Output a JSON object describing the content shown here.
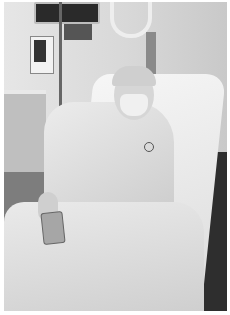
{
  "image": {
    "description": "Black and white photo of a person lying in a hospital bed wearing a surgical cap, face mask and gown, holding a phone, with medical monitors and IV pump in the background",
    "style": "grayscale"
  }
}
